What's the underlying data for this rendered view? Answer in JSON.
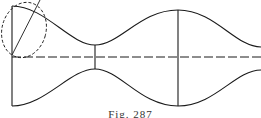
{
  "figure": {
    "caption": "Fig. 287",
    "stroke_color": "#1a1a1a",
    "elements": [
      {
        "name": "upper-profile-curve",
        "type": "curve"
      },
      {
        "name": "lower-profile-curve",
        "type": "curve"
      },
      {
        "name": "axis-of-symmetry",
        "type": "dashed-line"
      },
      {
        "name": "left-end-line",
        "type": "line"
      },
      {
        "name": "neck-diameter",
        "type": "line"
      },
      {
        "name": "bulge-diameter",
        "type": "line"
      },
      {
        "name": "generating-ellipse",
        "type": "dashed-ellipse"
      },
      {
        "name": "ellipse-diagonal",
        "type": "line"
      }
    ]
  }
}
